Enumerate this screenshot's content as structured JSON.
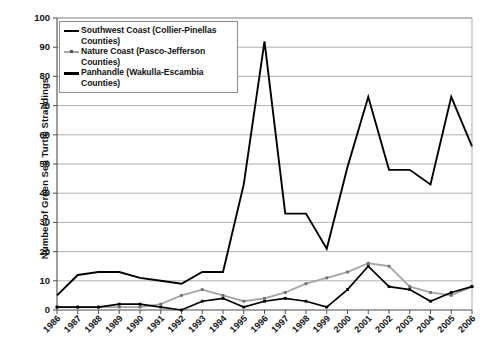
{
  "figure": {
    "faint_header": "",
    "background": "#ffffff"
  },
  "axes": {
    "ylabel": "Number of Green Sea Turtle Strandings",
    "xlabel": "",
    "yticks": [
      "0",
      "10",
      "20",
      "30",
      "40",
      "50",
      "60",
      "70",
      "80",
      "90",
      "100"
    ],
    "xticks": [
      "1986",
      "1987",
      "1988",
      "1989",
      "1990",
      "1991",
      "1992",
      "1993",
      "1994",
      "1995",
      "1996",
      "1997",
      "1998",
      "1999",
      "2000",
      "2001",
      "2002",
      "2003",
      "2004",
      "2005",
      "2006"
    ]
  },
  "legend": {
    "position": "upper-left-inside",
    "entries": [
      {
        "label": "Southwest Coast (Collier-Pinellas Counties)",
        "key": "sw",
        "color": "#000000"
      },
      {
        "label": "Nature Coast (Pasco-Jefferson Counties)",
        "key": "nc",
        "color": "#a5a5a5"
      },
      {
        "label": "Panhandle (Wakulla-Escambia Counties)",
        "key": "ph",
        "color": "#000000"
      }
    ]
  },
  "chart_data": {
    "type": "line",
    "title": "",
    "xlabel": "",
    "ylabel": "Number of Green Sea Turtle Strandings",
    "xlim": [
      1986,
      2006
    ],
    "ylim": [
      0,
      100
    ],
    "ytick_step": 10,
    "grid": true,
    "legend_position": "upper-left-inside",
    "x": [
      1986,
      1987,
      1988,
      1989,
      1990,
      1991,
      1992,
      1993,
      1994,
      1995,
      1996,
      1997,
      1998,
      1999,
      2000,
      2001,
      2002,
      2003,
      2004,
      2005,
      2006
    ],
    "series": [
      {
        "name": "Southwest Coast (Collier-Pinellas Counties)",
        "color": "#000000",
        "style": "thick-solid",
        "markers": false,
        "values": [
          5,
          12,
          13,
          13,
          11,
          10,
          9,
          13,
          13,
          43,
          92,
          33,
          33,
          21,
          49,
          73,
          48,
          48,
          43,
          73,
          56
        ]
      },
      {
        "name": "Nature Coast (Pasco-Jefferson Counties)",
        "color": "#a5a5a5",
        "style": "gray-solid",
        "markers": true,
        "values": [
          1,
          1,
          1,
          1,
          1,
          2,
          5,
          7,
          5,
          3,
          4,
          6,
          9,
          11,
          13,
          16,
          15,
          8,
          6,
          5,
          8
        ]
      },
      {
        "name": "Panhandle (Wakulla-Escambia Counties)",
        "color": "#000000",
        "style": "solid",
        "markers": true,
        "values": [
          1,
          1,
          1,
          2,
          2,
          1,
          0,
          3,
          4,
          1,
          3,
          4,
          3,
          1,
          7,
          15,
          8,
          7,
          3,
          6,
          8
        ]
      }
    ]
  }
}
